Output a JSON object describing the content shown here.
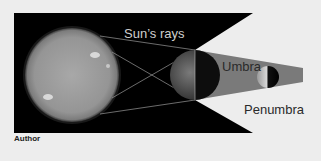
{
  "diagram": {
    "labels": {
      "sun_rays": "Sun’s rays",
      "umbra": "Umbra",
      "penumbra": "Penumbra"
    },
    "credit": "Author",
    "bodies": [
      {
        "name": "Sun",
        "cx": 72,
        "cy": 75,
        "r": 47
      },
      {
        "name": "Earth",
        "cx": 195,
        "cy": 75,
        "r": 25
      },
      {
        "name": "Moon",
        "cx": 268,
        "cy": 77,
        "r": 11
      }
    ],
    "colors": {
      "background": "#ededed",
      "space": "#000000",
      "umbra": "#7a7a7a",
      "sun": "#9a9a9a",
      "penumbra_region": "#f4f4f4"
    }
  }
}
